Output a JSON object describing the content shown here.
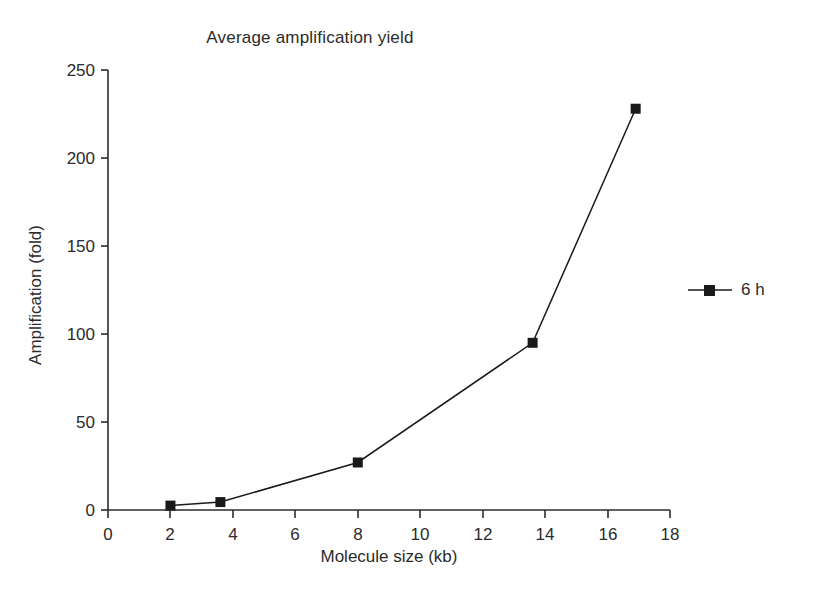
{
  "chart_data": {
    "type": "line",
    "title": "Average amplification yield",
    "xlabel": "Molecule size (kb)",
    "ylabel": "Amplification (fold)",
    "xlim": [
      0,
      18
    ],
    "ylim": [
      0,
      250
    ],
    "xticks": [
      0,
      2,
      4,
      6,
      8,
      10,
      12,
      14,
      16,
      18
    ],
    "yticks": [
      0,
      50,
      100,
      150,
      200,
      250
    ],
    "grid": false,
    "legend_position": "right",
    "marker": "square",
    "series": [
      {
        "name": "6 h",
        "color": "#1a1a1a",
        "x": [
          2.0,
          3.6,
          8.0,
          13.6,
          16.9
        ],
        "values": [
          2.5,
          4.5,
          27,
          95,
          228
        ]
      }
    ]
  },
  "legend": {
    "entries": [
      {
        "label": "6 h",
        "color": "#1a1a1a"
      }
    ]
  },
  "axes": {
    "x_tick_labels": [
      "0",
      "2",
      "4",
      "6",
      "8",
      "10",
      "12",
      "14",
      "16",
      "18"
    ],
    "y_tick_labels": [
      "0",
      "50",
      "100",
      "150",
      "200",
      "250"
    ]
  }
}
